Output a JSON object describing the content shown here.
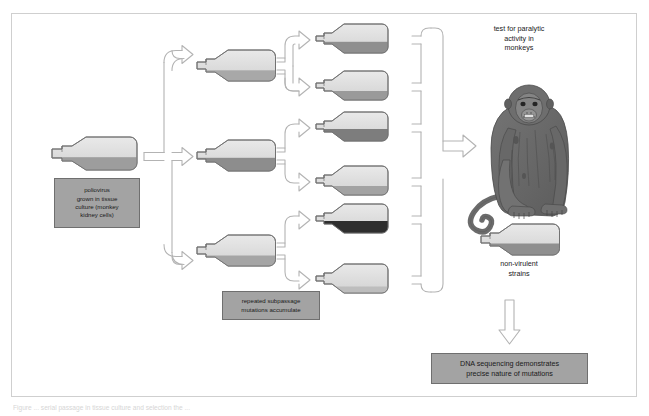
{
  "figure": {
    "type": "process-flow-diagram",
    "caption_partial": "Figure ... serial passage in tissue culture and selection the ..."
  },
  "boxes": {
    "poliovirus": {
      "name": "poliovirus-source-box",
      "lines": [
        "poliovirus",
        "grown in tissue",
        "culture (monkey",
        "kidney cells)"
      ]
    },
    "subpassage": {
      "name": "subpassage-box",
      "lines": [
        "repeated subpassage",
        "mutations accumulate"
      ]
    },
    "dna": {
      "name": "dna-sequencing-box",
      "lines": [
        "DNA sequencing demonstrates",
        "precise nature of mutations"
      ]
    }
  },
  "labels": {
    "test_monkeys": {
      "name": "test-paralytic-activity-label",
      "lines": [
        "test for paralytic",
        "activity in",
        "monkeys"
      ]
    },
    "non_virulent": {
      "name": "non-virulent-strains-label",
      "lines": [
        "non-virulent",
        "strains"
      ]
    }
  },
  "colors": {
    "frame_border": "#cfcfcf",
    "box_fill": "#a3a3a3",
    "box_border": "#6f6f6f",
    "bottle_glass_light": "#dcdcdc",
    "bottle_glass_top": "#e6e6e6",
    "bottle_outline": "#707070",
    "arrow_outline": "#b3b3b3",
    "monkey_body": "#6b6b6b",
    "monkey_dark": "#4a4a4a",
    "text": "#1a1a1a"
  },
  "flow": {
    "stage1_label": "single source culture flask",
    "stage2_label": "three subpassage flasks",
    "stage3_label": "six subpassage flasks with accumulated mutations",
    "stage4_label": "monkey paralytic activity test",
    "stage5_label": "non-virulent strain flask",
    "stage6_label": "DNA sequencing"
  },
  "bottles": {
    "source": {
      "name": "bottle-source",
      "fill_level": 0.42,
      "fill_color": "#9d9d9d"
    },
    "column2": [
      {
        "name": "bottle-p2-1",
        "fill_level": 0.34,
        "fill_color": "#a8a8a8"
      },
      {
        "name": "bottle-p2-2",
        "fill_level": 0.46,
        "fill_color": "#8d8d8d"
      },
      {
        "name": "bottle-p2-3",
        "fill_level": 0.33,
        "fill_color": "#a5a5a5"
      }
    ],
    "column3": [
      {
        "name": "bottle-p3-1",
        "fill_level": 0.4,
        "fill_color": "#8f8f8f"
      },
      {
        "name": "bottle-p3-2",
        "fill_level": 0.3,
        "fill_color": "#9a9a9a"
      },
      {
        "name": "bottle-p3-3",
        "fill_level": 0.48,
        "fill_color": "#7d7d7d"
      },
      {
        "name": "bottle-p3-4",
        "fill_level": 0.3,
        "fill_color": "#a3a3a3"
      },
      {
        "name": "bottle-p3-5",
        "fill_level": 0.47,
        "fill_color": "#2e2e2e"
      },
      {
        "name": "bottle-p3-6",
        "fill_level": 0.22,
        "fill_color": "#bdbdbd"
      }
    ],
    "non_virulent": {
      "name": "bottle-non-virulent",
      "fill_level": 0.4,
      "fill_color": "#8f8f8f"
    }
  }
}
